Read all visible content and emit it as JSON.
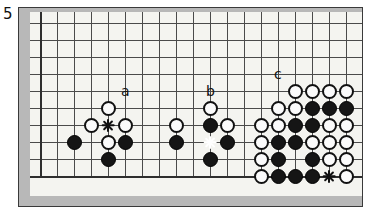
{
  "diagram": {
    "number_label": "5",
    "type": "go-board-problem",
    "board": {
      "grid_cols": 19,
      "grid_rows": 10,
      "cell_size": 17,
      "origin_x": 10,
      "origin_y": 11,
      "surface_color": "#f4f4f0",
      "frame_color": "#b8b8b8",
      "line_color": "#4a4a4a",
      "edges_shown": [
        "left",
        "bottom",
        "right"
      ]
    },
    "colors": {
      "black_stone": "#151515",
      "white_stone": "#fbfbfb",
      "stone_outline": "#111111",
      "marker": "#111111",
      "marker_on_black": "#ffffff"
    },
    "letter_labels": [
      {
        "text": "a",
        "col": 5,
        "row": 4
      },
      {
        "text": "b",
        "col": 10,
        "row": 4
      },
      {
        "text": "c",
        "col": 14,
        "row": 3
      }
    ],
    "stones": [
      {
        "color": "white",
        "col": 4,
        "row": 5
      },
      {
        "color": "white",
        "col": 3,
        "row": 6
      },
      {
        "color": "white",
        "col": 5,
        "row": 6
      },
      {
        "color": "black",
        "col": 2,
        "row": 7
      },
      {
        "color": "white",
        "col": 4,
        "row": 7
      },
      {
        "color": "black",
        "col": 5,
        "row": 7
      },
      {
        "color": "black",
        "col": 4,
        "row": 8
      },
      {
        "color": "white",
        "col": 10,
        "row": 5
      },
      {
        "color": "white",
        "col": 8,
        "row": 6
      },
      {
        "color": "black",
        "col": 10,
        "row": 6
      },
      {
        "color": "white",
        "col": 11,
        "row": 6
      },
      {
        "color": "black",
        "col": 8,
        "row": 7
      },
      {
        "color": "black",
        "col": 11,
        "row": 7
      },
      {
        "color": "black",
        "col": 10,
        "row": 8
      },
      {
        "color": "white",
        "col": 15,
        "row": 4
      },
      {
        "color": "white",
        "col": 16,
        "row": 4
      },
      {
        "color": "white",
        "col": 17,
        "row": 4
      },
      {
        "color": "white",
        "col": 18,
        "row": 4
      },
      {
        "color": "white",
        "col": 14,
        "row": 5
      },
      {
        "color": "white",
        "col": 15,
        "row": 5
      },
      {
        "color": "black",
        "col": 16,
        "row": 5
      },
      {
        "color": "black",
        "col": 17,
        "row": 5
      },
      {
        "color": "black",
        "col": 18,
        "row": 5
      },
      {
        "color": "white",
        "col": 13,
        "row": 6
      },
      {
        "color": "white",
        "col": 14,
        "row": 6
      },
      {
        "color": "black",
        "col": 15,
        "row": 6
      },
      {
        "color": "black",
        "col": 16,
        "row": 6
      },
      {
        "color": "white",
        "col": 17,
        "row": 6
      },
      {
        "color": "white",
        "col": 18,
        "row": 6
      },
      {
        "color": "white",
        "col": 13,
        "row": 7
      },
      {
        "color": "black",
        "col": 14,
        "row": 7
      },
      {
        "color": "black",
        "col": 15,
        "row": 7
      },
      {
        "color": "white",
        "col": 16,
        "row": 7
      },
      {
        "color": "white",
        "col": 17,
        "row": 7
      },
      {
        "color": "white",
        "col": 18,
        "row": 7
      },
      {
        "color": "white",
        "col": 13,
        "row": 8
      },
      {
        "color": "black",
        "col": 14,
        "row": 8
      },
      {
        "color": "black",
        "col": 16,
        "row": 8
      },
      {
        "color": "white",
        "col": 17,
        "row": 8
      },
      {
        "color": "white",
        "col": 18,
        "row": 8
      },
      {
        "color": "white",
        "col": 13,
        "row": 9
      },
      {
        "color": "black",
        "col": 14,
        "row": 9
      },
      {
        "color": "black",
        "col": 15,
        "row": 9
      },
      {
        "color": "black",
        "col": 16,
        "row": 9
      },
      {
        "color": "white",
        "col": 18,
        "row": 9
      }
    ],
    "markers": [
      {
        "kind": "x",
        "on": "empty",
        "col": 4,
        "row": 6
      },
      {
        "kind": "x",
        "on": "black",
        "col": 10,
        "row": 7
      },
      {
        "kind": "x",
        "on": "empty",
        "col": 17,
        "row": 9
      }
    ]
  }
}
